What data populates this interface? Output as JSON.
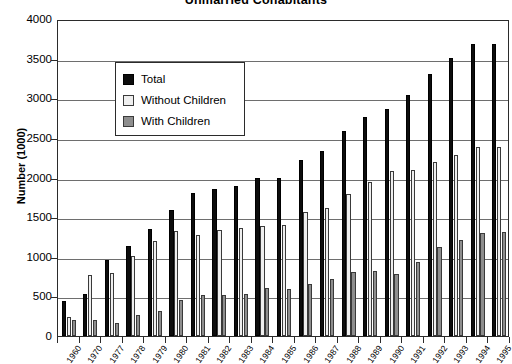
{
  "chart_data": {
    "type": "bar",
    "title": "Unmarried Cohabitants",
    "xlabel": "",
    "ylabel": "Number (1000)",
    "ylim": [
      0,
      4000
    ],
    "ytick_step": 500,
    "yticks": [
      0,
      500,
      1000,
      1500,
      2000,
      2500,
      3000,
      3500,
      4000
    ],
    "ytick_labels": [
      "0",
      "500",
      "1000",
      "1500",
      "2000",
      "2500",
      "3000",
      "3500",
      "4000"
    ],
    "grid": true,
    "legend_position": "upper-left-inset",
    "categories": [
      "1960",
      "1970",
      "1977",
      "1978",
      "1979",
      "1980",
      "1981",
      "1982",
      "1983",
      "1984",
      "1985",
      "1986",
      "1987",
      "1988",
      "1989",
      "1990",
      "1991",
      "1992",
      "1993",
      "1994",
      "1995"
    ],
    "series": [
      {
        "name": "Total",
        "color": "#0d0d0d",
        "values": [
          440,
          530,
          960,
          1140,
          1350,
          1590,
          1810,
          1860,
          1890,
          1990,
          1990,
          2220,
          2330,
          2590,
          2760,
          2860,
          3040,
          3310,
          3510,
          3680,
          3690
        ]
      },
      {
        "name": "Without Children",
        "color": "#efefef",
        "values": [
          240,
          770,
          800,
          1010,
          1200,
          1320,
          1280,
          1340,
          1360,
          1390,
          1400,
          1560,
          1610,
          1790,
          1940,
          2080,
          2100,
          2190,
          2290,
          2380,
          2380
        ]
      },
      {
        "name": "With Children",
        "color": "#8e8e8e",
        "values": [
          200,
          200,
          160,
          270,
          310,
          460,
          520,
          520,
          530,
          600,
          590,
          660,
          720,
          810,
          820,
          780,
          940,
          1120,
          1210,
          1300,
          1310
        ]
      }
    ]
  },
  "legend": {
    "items": [
      {
        "label": "Total",
        "key": "total"
      },
      {
        "label": "Without Children",
        "key": "without"
      },
      {
        "label": "With Children",
        "key": "with"
      }
    ]
  }
}
